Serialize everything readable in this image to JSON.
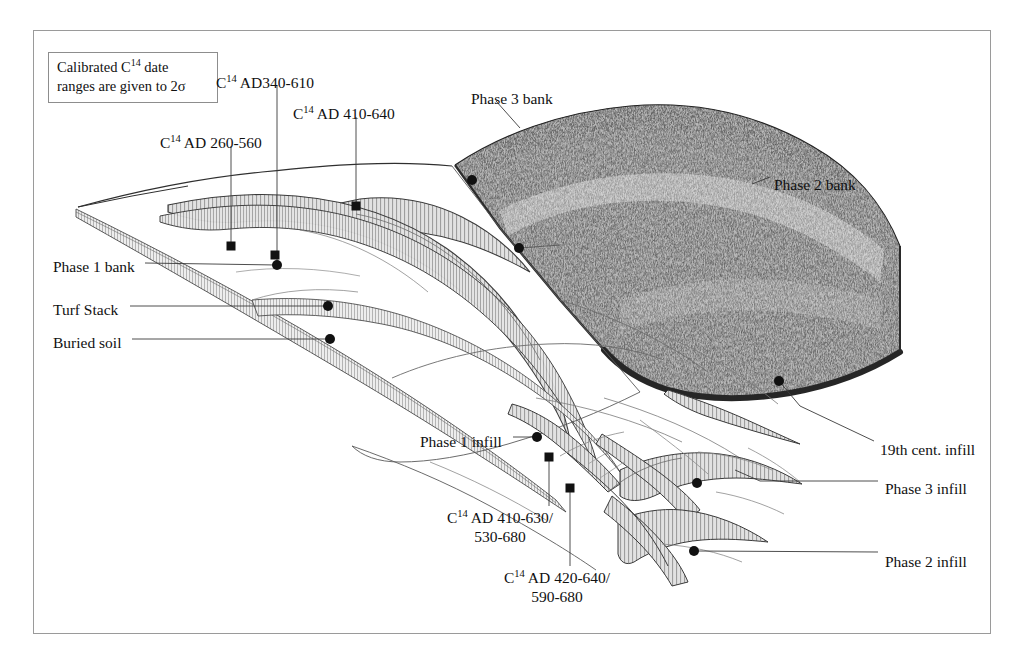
{
  "figure": {
    "domain": "archaeological-section-diagram",
    "frame": {
      "border_color": "#9a9a9a",
      "background": "#ffffff"
    }
  },
  "legend": {
    "line1_pre": "Calibrated C",
    "line1_sup": "14",
    "line1_post": " date",
    "line2": "ranges are given to 2σ"
  },
  "c14_labels": [
    {
      "id": "c14-ad-260-560",
      "pre": "C",
      "sup": "14",
      "post": "AD 260-560",
      "x": 160,
      "y": 133
    },
    {
      "id": "c14-ad-340-610",
      "pre": "C",
      "sup": "14",
      "post": "AD340-610",
      "x": 216,
      "y": 73
    },
    {
      "id": "c14-ad-410-640",
      "pre": "C",
      "sup": "14",
      "post": "AD 410-640",
      "x": 293,
      "y": 104
    },
    {
      "id": "c14-ad-410-630-530-680",
      "pre": "C",
      "sup": "14",
      "post": "AD 410-630/",
      "post2": "530-680",
      "x": 447,
      "y": 508
    },
    {
      "id": "c14-ad-420-640-590-680",
      "pre": "C",
      "sup": "14",
      "post": "AD 420-640/",
      "post2": "590-680",
      "x": 504,
      "y": 568
    }
  ],
  "feature_labels": [
    {
      "id": "phase-3-bank",
      "text": "Phase 3 bank",
      "x": 471,
      "y": 89,
      "align": "left"
    },
    {
      "id": "phase-2-bank",
      "text": "Phase 2 bank",
      "x": 774,
      "y": 175,
      "align": "left"
    },
    {
      "id": "phase-1-bank",
      "text": "Phase 1 bank",
      "x": 53,
      "y": 257,
      "align": "left"
    },
    {
      "id": "turf-stack",
      "text": "Turf Stack",
      "x": 53,
      "y": 300,
      "align": "left"
    },
    {
      "id": "buried-soil",
      "text": "Buried soil",
      "x": 53,
      "y": 333,
      "align": "left"
    },
    {
      "id": "phase-1-infill",
      "text": "Phase 1 infill",
      "x": 420,
      "y": 432,
      "align": "left"
    },
    {
      "id": "19th-cent-infill",
      "text": "19th cent. infill",
      "x": 880,
      "y": 440,
      "align": "left"
    },
    {
      "id": "phase-3-infill",
      "text": "Phase 3 infill",
      "x": 885,
      "y": 479,
      "align": "left"
    },
    {
      "id": "phase-2-infill",
      "text": "Phase 2 infill",
      "x": 885,
      "y": 552,
      "align": "left"
    }
  ],
  "sample_markers": {
    "squares": [
      {
        "x": 231,
        "y": 246
      },
      {
        "x": 275,
        "y": 255
      },
      {
        "x": 356,
        "y": 206
      },
      {
        "x": 549,
        "y": 457
      },
      {
        "x": 570,
        "y": 488
      }
    ],
    "circles": [
      {
        "x": 277,
        "y": 265
      },
      {
        "x": 328,
        "y": 306
      },
      {
        "x": 330,
        "y": 339
      },
      {
        "x": 472,
        "y": 180
      },
      {
        "x": 519,
        "y": 248
      },
      {
        "x": 537,
        "y": 437
      },
      {
        "x": 779,
        "y": 381
      },
      {
        "x": 697,
        "y": 483
      },
      {
        "x": 694,
        "y": 551
      }
    ]
  },
  "colors": {
    "ink": "#111111",
    "hatch_fill": "#dedede",
    "hatch_line": "#8a8a8a",
    "turf_dark": "#2f2f2f",
    "turf_mid": "#6f6f6f",
    "leader": "#3a3a3a",
    "frame": "#9a9a9a"
  }
}
